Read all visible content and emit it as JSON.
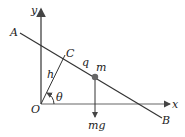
{
  "diagram": {
    "axes": {
      "x_label": "x",
      "y_label": "y",
      "origin_label": "O"
    },
    "line": {
      "start_label": "A",
      "end_label": "B"
    },
    "points": {
      "foot_label": "C",
      "mass_label": "m"
    },
    "segments": {
      "perpendicular_label": "h",
      "distance_label": "q"
    },
    "angle_label": "θ",
    "force_label": "mg",
    "colors": {
      "stroke": "#333333",
      "mass": "#666666",
      "axis": "#555555"
    }
  }
}
